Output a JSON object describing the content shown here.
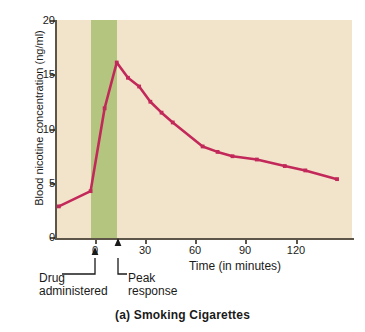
{
  "chart_data": {
    "type": "line",
    "title": "(a) Smoking Cigarettes",
    "xlabel": "Time (in minutes)",
    "ylabel": "Blood nicotine concentration (ng/ml)",
    "xlim": [
      -18,
      140
    ],
    "ylim": [
      0,
      20
    ],
    "xticks": [
      0,
      30,
      60,
      90,
      120
    ],
    "xticklabels": [
      "0",
      "30",
      "60",
      "90",
      "120"
    ],
    "yticks": [
      0,
      5,
      10,
      15,
      20
    ],
    "yticklabels": [
      "0",
      "5",
      "10",
      "15",
      "20"
    ],
    "grid": false,
    "legend": null,
    "series": [
      {
        "name": "Blood nicotine concentration",
        "color": "#c2285a",
        "x": [
          -17,
          0,
          7.5,
          14,
          20,
          26,
          32,
          38,
          44,
          60,
          68,
          76,
          89,
          104,
          115,
          132
        ],
        "values": [
          2.9,
          4.3,
          11.9,
          16.1,
          14.7,
          13.9,
          12.5,
          11.5,
          10.6,
          8.4,
          7.9,
          7.5,
          7.2,
          6.6,
          6.2,
          5.4
        ]
      }
    ],
    "bands": [
      {
        "name": "drug-administration-band",
        "x_start": 0,
        "x_end": 14,
        "color": "#b4c57f"
      }
    ],
    "annotations": [
      {
        "name": "drug-administered",
        "text_line1": "Drug",
        "text_line2": "administered",
        "x": 0
      },
      {
        "name": "peak-response",
        "text_line1": "Peak",
        "text_line2": "response",
        "x": 14
      }
    ],
    "plot_background": "#f2e4cb",
    "axis_color": "#5c5548"
  },
  "axis": {
    "y_title": "Blood nicotine concentration (ng/ml)",
    "x_title": "Time (in minutes)"
  },
  "annotations": {
    "drug_line1": "Drug",
    "drug_line2": "administered",
    "peak_line1": "Peak",
    "peak_line2": "response"
  },
  "caption": {
    "text": "(a) Smoking Cigarettes"
  }
}
